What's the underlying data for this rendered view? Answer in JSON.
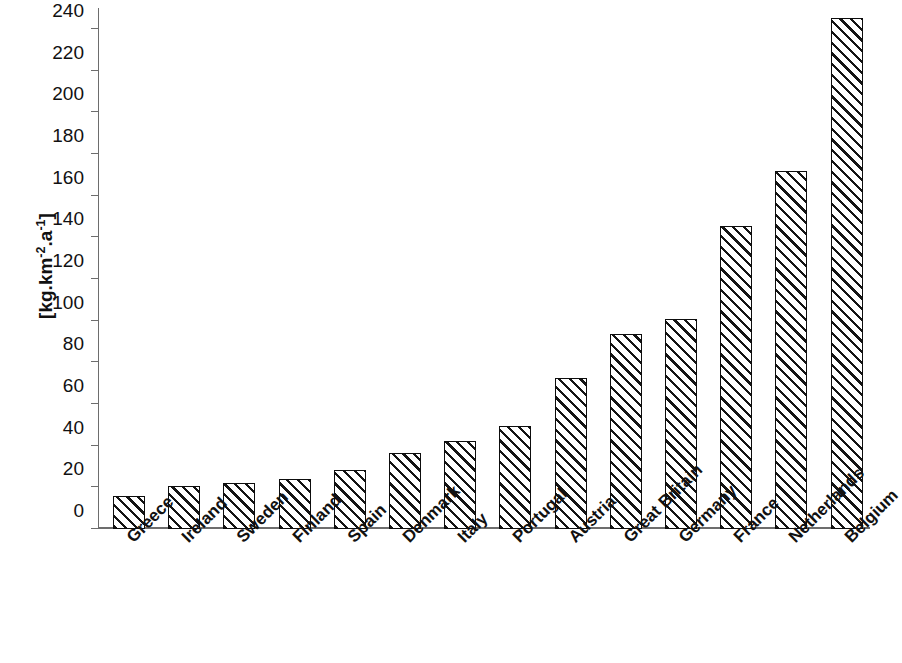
{
  "chart_data": {
    "type": "bar",
    "title": "",
    "subtitle": "",
    "xlabel": "",
    "ylabel": "[kg.km-2.a-1]",
    "ylabel_parts": {
      "prefix": "[kg.km",
      "sup1": "-2",
      "mid": ".a",
      "sup2": "-1",
      "suffix": "]"
    },
    "categories": [
      "Greece",
      "Ireland",
      "Sweden",
      "Finland",
      "Spain",
      "Denmark",
      "Italy",
      "Portugal",
      "Austria",
      "Great Britain",
      "Germany",
      "France",
      "Netherlands",
      "Belgium"
    ],
    "values": [
      16,
      20.5,
      22,
      24,
      28.5,
      36.5,
      42,
      49.5,
      72.5,
      93.5,
      101,
      145.5,
      172,
      245
    ],
    "ylim": [
      0,
      250
    ],
    "yticks": [
      0,
      20,
      40,
      60,
      80,
      100,
      120,
      140,
      160,
      180,
      200,
      220,
      240
    ],
    "ytick_labels": [
      "0",
      "20",
      "40",
      "60",
      "80",
      "100",
      "120",
      "140",
      "160",
      "180",
      "200",
      "220",
      "240"
    ],
    "grid": false,
    "legend": null,
    "bar_style": {
      "fill": "diagonal-hatch",
      "hatch_color": "#141414",
      "background": "#ffffff",
      "border_color": "#0d0d0d"
    },
    "axis_color": "#6d6d6d",
    "label_rotation_deg": -45
  }
}
